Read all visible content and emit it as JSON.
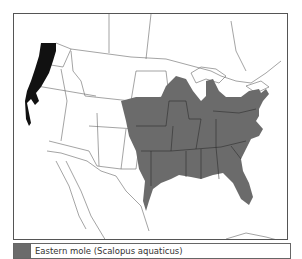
{
  "map": {
    "title": "Range map",
    "region": "North America (United States)",
    "colors": {
      "eastern_range": "#6b6b6b",
      "western_range": "#111111",
      "borders": "#555555",
      "background": "#ffffff"
    }
  },
  "legend": {
    "items": [
      {
        "label": "Eastern mole (Scalopus aquaticus)",
        "color": "#6b6b6b"
      }
    ]
  }
}
